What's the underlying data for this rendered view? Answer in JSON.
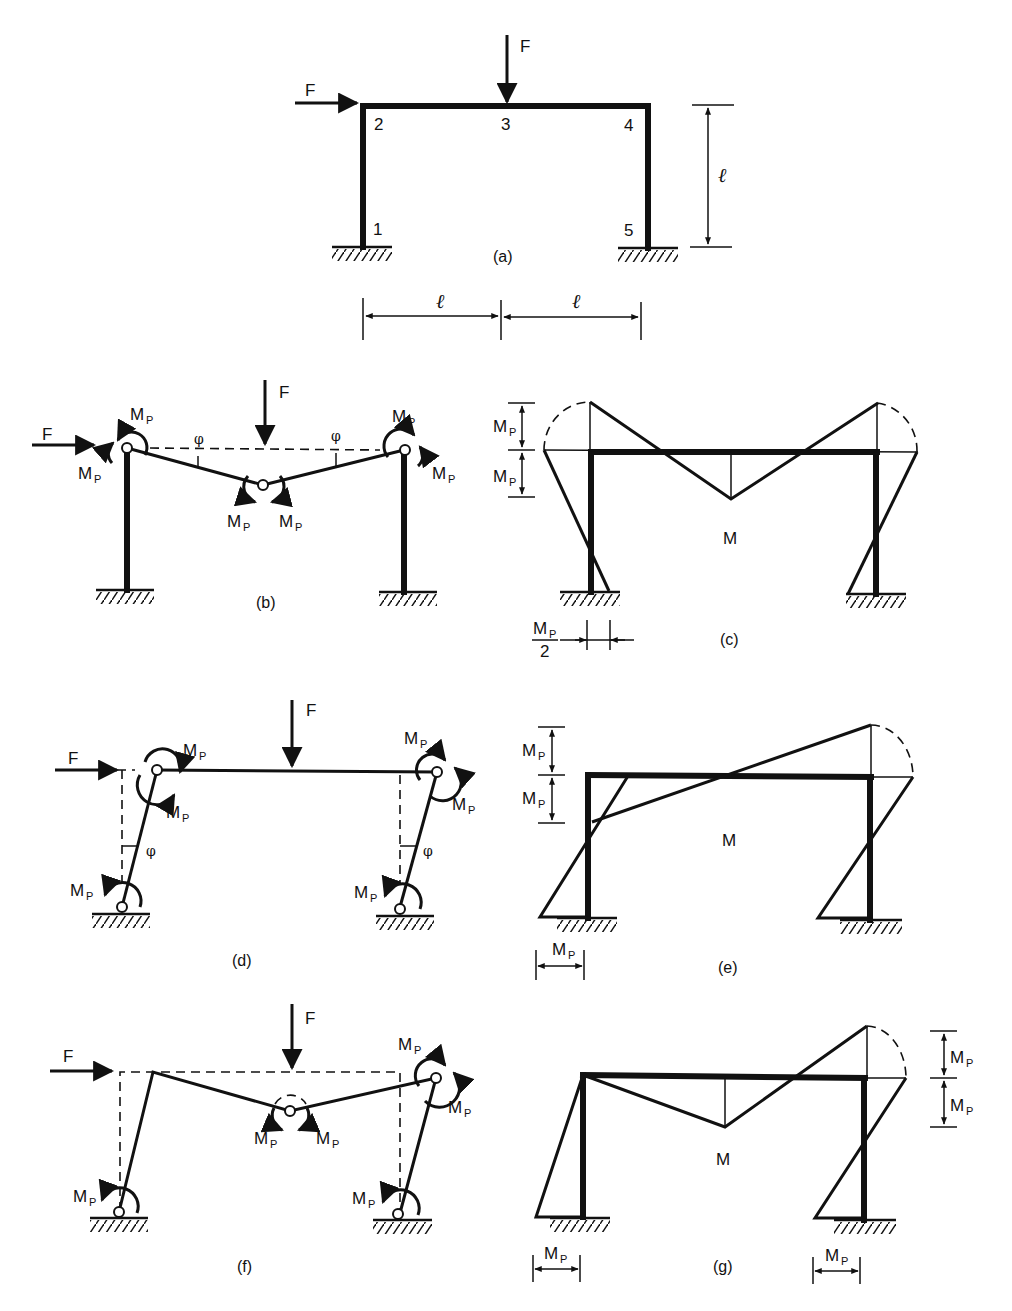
{
  "figure": {
    "panel_a": {
      "caption": "(a)",
      "loads": {
        "horizontal": "F",
        "vertical": "F"
      },
      "nodes": [
        "1",
        "2",
        "3",
        "4",
        "5"
      ],
      "dim_height": "ℓ",
      "dim_span_left": "ℓ",
      "dim_span_right": "ℓ"
    },
    "panel_b": {
      "caption": "(b)",
      "loads": {
        "horizontal": "F",
        "vertical": "F"
      },
      "moment_label": "M",
      "moment_sub": "P",
      "angle_label": "φ"
    },
    "panel_c": {
      "caption": "(c)",
      "diagram_label": "M",
      "moment_label": "M",
      "moment_sub": "P",
      "half_denominator": "2"
    },
    "panel_d": {
      "caption": "(d)",
      "loads": {
        "horizontal": "F",
        "vertical": "F"
      },
      "moment_label": "M",
      "moment_sub": "P",
      "angle_label": "φ"
    },
    "panel_e": {
      "caption": "(e)",
      "diagram_label": "M",
      "moment_label": "M",
      "moment_sub": "P"
    },
    "panel_f": {
      "caption": "(f)",
      "loads": {
        "horizontal": "F",
        "vertical": "F"
      },
      "moment_label": "M",
      "moment_sub": "P"
    },
    "panel_g": {
      "caption": "(g)",
      "diagram_label": "M",
      "moment_label": "M",
      "moment_sub": "P"
    }
  }
}
